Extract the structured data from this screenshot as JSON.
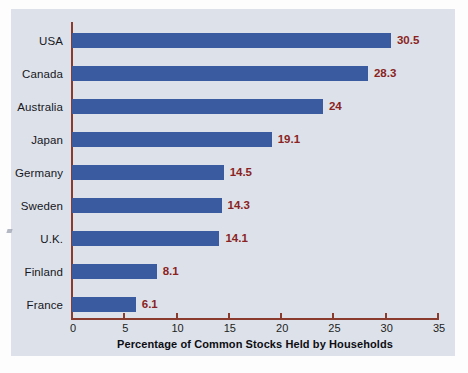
{
  "chart_data": {
    "type": "bar",
    "orientation": "horizontal",
    "title": "",
    "xlabel": "Percentage of Common Stocks Held by Households",
    "ylabel": "",
    "xlim": [
      0,
      35
    ],
    "xticks": [
      "0",
      "5",
      "10",
      "15",
      "20",
      "25",
      "30",
      "35"
    ],
    "grid": false,
    "legend": null,
    "categories": [
      "USA",
      "Canada",
      "Australia",
      "Japan",
      "Germany",
      "Sweden",
      "U.K.",
      "Finland",
      "France"
    ],
    "values": [
      30.5,
      28.3,
      24,
      19.1,
      14.5,
      14.3,
      14.1,
      8.1,
      6.1
    ],
    "value_labels": [
      "30.5",
      "28.3",
      "24",
      "19.1",
      "14.5",
      "14.3",
      "14.1",
      "8.1",
      "6.1"
    ],
    "colors": {
      "bar": "#3a5ba0",
      "axis": "#8b3a2e",
      "value_label": "#8b2222",
      "panel_background": "#dde2ea",
      "figure_background": "#fdfdfe",
      "category_label": "#16161c"
    }
  }
}
